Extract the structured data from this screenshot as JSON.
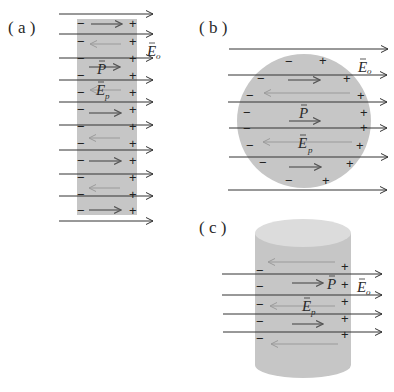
{
  "colors": {
    "background": "#ffffff",
    "dielectric_fill": "#c6c6c6",
    "cylinder_top": "#dcdcdc",
    "external_field_arrow": "#333333",
    "polarization_arrow": "#555555",
    "depolarization_arrow": "#9a9a9a",
    "sign_color": "#222222"
  },
  "panels": {
    "a": {
      "label": "( a )",
      "shape": "slab",
      "field_label": {
        "symbol": "E",
        "sub": "o"
      },
      "polarization_label": {
        "symbol": "P"
      },
      "depolarization_label": {
        "symbol": "E",
        "sub": "p"
      },
      "negative_sign": "−",
      "positive_sign": "+"
    },
    "b": {
      "label": "( b )",
      "shape": "sphere",
      "field_label": {
        "symbol": "E",
        "sub": "o"
      },
      "polarization_label": {
        "symbol": "P"
      },
      "depolarization_label": {
        "symbol": "E",
        "sub": "p"
      },
      "negative_sign": "−",
      "positive_sign": "+"
    },
    "c": {
      "label": "( c )",
      "shape": "cylinder",
      "field_label": {
        "symbol": "E",
        "sub": "o"
      },
      "polarization_label": {
        "symbol": "P"
      },
      "depolarization_label": {
        "symbol": "E",
        "sub": "p"
      },
      "negative_sign": "−",
      "positive_sign": "+"
    }
  },
  "vector_accent": "→"
}
